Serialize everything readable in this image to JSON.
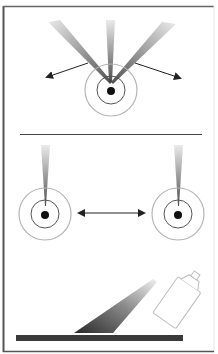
{
  "figure": {
    "panels": [
      {
        "name": "radiating-source",
        "beam_count": 3,
        "arrow_count": 2
      },
      {
        "name": "two-sources",
        "source_count": 2,
        "arrow": "double-headed"
      },
      {
        "name": "spray-can",
        "object": "aerosol spray can",
        "surface": "flat bar"
      }
    ]
  },
  "colors": {
    "frame": "#555555",
    "divider": "#444444",
    "ring_outer": "#b0b0b0",
    "ring_inner": "#555555",
    "dot": "#111111",
    "beam_dark": "#444444",
    "beam_light": "#e6e6e6",
    "arrow": "#222222",
    "bar": "#3a3a3a",
    "can_outline": "#bdbdbd"
  }
}
